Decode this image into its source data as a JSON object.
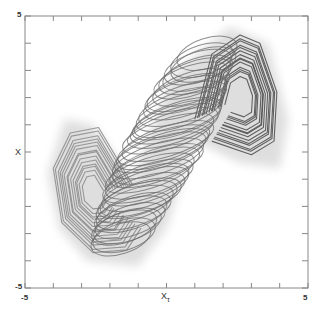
{
  "chart_data": {
    "type": "line",
    "title": "",
    "xlabel": "X",
    "xlabel_subscript": "τ",
    "ylabel": "X",
    "xlim": [
      -5,
      5
    ],
    "ylim": [
      -5,
      5
    ],
    "x_tick_labels": [
      "-5",
      "5"
    ],
    "y_tick_labels": [
      "-5",
      "5"
    ],
    "x_ticks": [
      -5,
      -4,
      -3,
      -2,
      -1,
      0,
      1,
      2,
      3,
      4,
      5
    ],
    "y_ticks": [
      -5,
      -4,
      -3,
      -2,
      -1,
      0,
      1,
      2,
      3,
      4,
      5
    ],
    "grid": false,
    "legend": null,
    "colors": {
      "frame": "#888888",
      "halo": "#d9d9d9",
      "left_lobe": "#8a8a8a",
      "center_band": "#6a6a6a",
      "right_lobe": "#4a4a4a"
    },
    "series": [
      {
        "name": "left-lobe",
        "description": "Nested loops on the left side, peaking near (-3.2, 0.8) and bottoming near (-2.4, -3.6)",
        "center": [
          -2.6,
          -1.6
        ],
        "loops": 14
      },
      {
        "name": "center-band",
        "description": "Dense tilted stack of elliptical loops running from lower-left (-1.5,-3) to upper-right (1.5,3.5)",
        "from": [
          -1.6,
          -3.2
        ],
        "to": [
          1.4,
          3.6
        ],
        "loops": 40
      },
      {
        "name": "right-lobe",
        "description": "Nested loops on the right side, peaking near (2.8, 4.2) and extending down to (3.6, 0.2)",
        "center": [
          2.6,
          2.0
        ],
        "loops": 14
      }
    ]
  },
  "axes": {
    "x_min_label": "-5",
    "x_max_label": "5",
    "y_min_label": "-5",
    "y_max_label": "5",
    "x_axis_label": "X",
    "x_axis_subscript": "τ",
    "y_axis_label": "X"
  }
}
